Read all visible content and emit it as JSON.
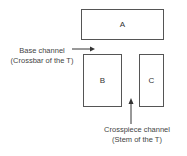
{
  "diagram": {
    "boxes": [
      {
        "id": "A",
        "label": "A"
      },
      {
        "id": "B",
        "label": "B"
      },
      {
        "id": "C",
        "label": "C"
      }
    ],
    "annotations": {
      "base_channel": {
        "line1": "Base channel",
        "line2": "(Crossbar of the T)"
      },
      "crosspiece_channel": {
        "line1": "Crosspiece channel",
        "line2": "(Stem of the T)"
      }
    },
    "colors": {
      "stroke": "#555555",
      "text": "#333333",
      "background": "#ffffff"
    }
  }
}
